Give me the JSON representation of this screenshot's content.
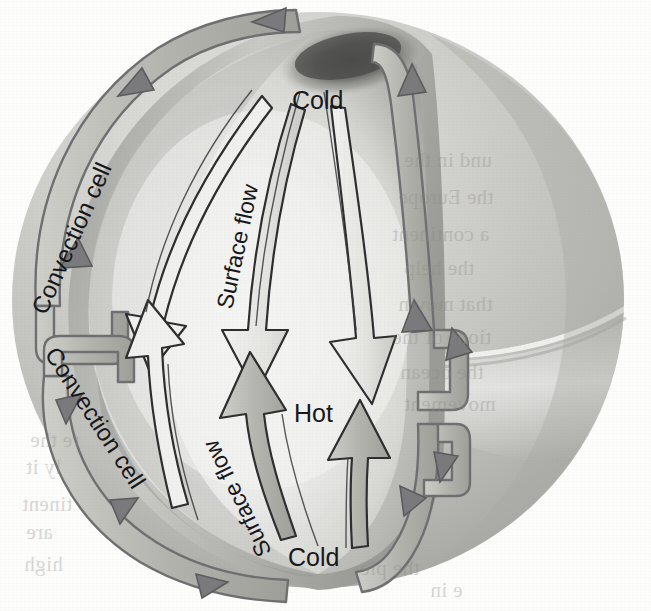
{
  "figure": {
    "type": "scientific-illustration",
    "medium": "scanned textbook page, grayscale halftone"
  },
  "labels": {
    "cold_top": "Cold",
    "cold_bottom": "Cold",
    "hot_middle": "Hot",
    "surface_flow_upper": "Surface flow",
    "surface_flow_lower": "Surface flow",
    "convection_cell_upper": "Convection cell",
    "convection_cell_lower": "Convection cell"
  },
  "colors": {
    "page_background": "#fdfdfc",
    "sphere_outer_light": "#d9d9d6",
    "sphere_outer_mid": "#bcbcb8",
    "sphere_outer_dark": "#9a9a96",
    "cutaway_interior_light": "#efefec",
    "cutaway_interior_mid": "#cfcfca",
    "cutaway_interior_dark": "#8e8e8a",
    "polar_shadow": "#5e5e5b",
    "arrow_fill": "#b9b9b4",
    "arrow_fill_light": "#e6e6e2",
    "arrow_stroke": "#3a3a3c",
    "loop_stroke": "#6f6f72",
    "label_text": "#17171a"
  },
  "bleed_through": [
    {
      "text": "und in the",
      "x": 404,
      "y": 148
    },
    {
      "text": "the Europe",
      "x": 398,
      "y": 185
    },
    {
      "text": "a continent",
      "x": 392,
      "y": 222
    },
    {
      "text": "the help",
      "x": 404,
      "y": 256
    },
    {
      "text": "that movin",
      "x": 398,
      "y": 292
    },
    {
      "text": "tions of the",
      "x": 392,
      "y": 325
    },
    {
      "text": "the ocean",
      "x": 400,
      "y": 360
    },
    {
      "text": "movement",
      "x": 404,
      "y": 392
    },
    {
      "text": "re the",
      "x": 30,
      "y": 428
    },
    {
      "text": "ly it",
      "x": 26,
      "y": 455
    },
    {
      "text": "tinent",
      "x": 22,
      "y": 492
    },
    {
      "text": "are",
      "x": 26,
      "y": 520
    },
    {
      "text": "high",
      "x": 24,
      "y": 552
    },
    {
      "text": "the ple",
      "x": 360,
      "y": 556
    },
    {
      "text": "e in",
      "x": 430,
      "y": 578
    }
  ]
}
